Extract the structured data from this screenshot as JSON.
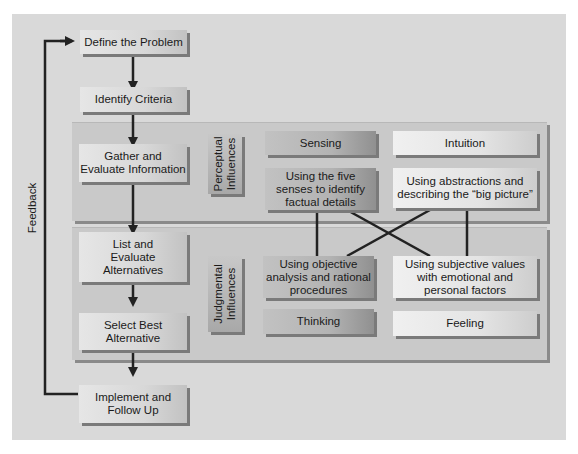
{
  "diagram": {
    "feedback_label": "Feedback",
    "steps": [
      {
        "id": "define",
        "label": "Define the Problem"
      },
      {
        "id": "identify",
        "label": "Identify Criteria"
      },
      {
        "id": "gather",
        "label": "Gather and\nEvaluate Information"
      },
      {
        "id": "list",
        "label": "List and\nEvaluate\nAlternatives"
      },
      {
        "id": "select",
        "label": "Select Best\nAlternative"
      },
      {
        "id": "implement",
        "label": "Implement and\nFollow Up"
      }
    ],
    "perceptual": {
      "label": "Perceptual\nInfluences",
      "sensing": {
        "title": "Sensing",
        "desc": "Using the five\nsenses to identify\nfactual details"
      },
      "intuition": {
        "title": "Intuition",
        "desc": "Using abstractions and\ndescribing the “big picture”"
      }
    },
    "judgmental": {
      "label": "Judgmental\nInfluences",
      "thinking": {
        "title": "Thinking",
        "desc": "Using objective\nanalysis and rational\nprocedures"
      },
      "feeling": {
        "title": "Feeling",
        "desc": "Using subjective values\nwith emotional and\npersonal factors"
      }
    }
  }
}
